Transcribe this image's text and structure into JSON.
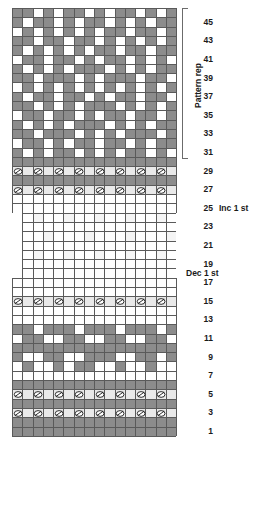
{
  "chart": {
    "columns": 16,
    "rows": 46,
    "cell_width": 10.25,
    "cell_height": 9.3,
    "origin_x": 12,
    "origin_y": 8,
    "colors": {
      "main": "#ffffff",
      "contrast": "#8c8c8c",
      "pale": "#e9e9e9",
      "grid": "#5a5a5a"
    },
    "row_numbers": [
      45,
      43,
      41,
      39,
      37,
      35,
      33,
      31,
      29,
      27,
      25,
      23,
      21,
      19,
      17,
      15,
      13,
      11,
      9,
      7,
      5,
      3,
      1
    ],
    "annotations": [
      {
        "label": "Inc 1 st",
        "row": 25
      },
      {
        "label": "Dec 1 st",
        "row": 18
      }
    ],
    "repeat_bracket": {
      "label": "Pattern rep",
      "from_row": 31,
      "to_row": 46
    },
    "symbol_name": "yarn-over-eyelet",
    "symbol_rows": [
      3,
      5,
      15,
      27,
      29
    ],
    "symbol_start_col": 0,
    "symbol_step": 2,
    "symbol_count": 8,
    "inset_rows": [
      18,
      19,
      20,
      21,
      22,
      23,
      24
    ],
    "grid_map": [
      "1:gggggggggggggggg",
      "2:gggggggggggggggg",
      "3:pppppppppppppppp",
      "4:gggggggggggggggg",
      "5:pppppppppppppppp",
      "6:gggggggggggggggg",
      "7:................",
      "8:.g..g.gg..g..g..",
      "9:g..gg..ggg..gg.g",
      "10:gggggggggggggggg",
      "11:.gg..gg..gg..gg.",
      "12:gg.ggg.ggg.ggg.g",
      "13:................",
      "14:................",
      "15:pppppppppppppppp",
      "16:................",
      "17:................",
      "18:...............",
      "19:...............",
      "20:.l..l..l..l..l.",
      "21:...............",
      "22:..l...l...l...l",
      "23:...............",
      "24:.l..l..l..l..l.",
      "25:................",
      "26:................",
      "27:pppppppppppppppp",
      "28:gggggggggggggggg",
      "29:pppppppppppppppp",
      "30:gggggggggggggggg",
      "31:g.g.gg.g.g.gg.g.",
      "32:.gg.g.gg.gg.g.gg",
      "33:gg.ggg.g.g.ggg.g",
      "34:g.g.g.ggg.g.g.gg",
      "35:.gg.gg.g.gg.gg.g",
      "36:gg.g.g.ggg.g.g.g",
      "37:g.gg.gg.g.gg.gg.",
      "38:.g.g.g.g.g.g.g.g",
      "39:gg.ggg.g.ggg.gg.",
      "40:g.g.g.ggg.g.g.gg",
      "41:.gg.gg.g.gg.g.g.",
      "42:g.g.g.g.gg.gg.gg",
      "43:gg.gg.gg.g.g.g.g",
      "44:.g.g.g.g.gg.gg.g",
      "45:g.gg.g.gg.g.g.gg",
      "46:gg.g.gg.g.gg.g.g"
    ]
  }
}
